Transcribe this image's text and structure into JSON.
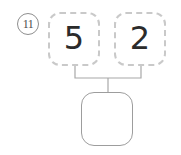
{
  "worksheet": {
    "problem_number": "11",
    "type": "number-bond",
    "parts": [
      {
        "label": "5",
        "style": "dashed",
        "filled": true
      },
      {
        "label": "2",
        "style": "dashed",
        "filled": true
      }
    ],
    "whole": {
      "label": "",
      "style": "solid",
      "filled": false
    },
    "colors": {
      "part_border": "#c9c9c9",
      "whole_border": "#9d9d9d",
      "connector": "#a8a8a8",
      "digit": "#2b2b2b",
      "problem_number": "#4a4a4a",
      "background": "#ffffff"
    }
  }
}
